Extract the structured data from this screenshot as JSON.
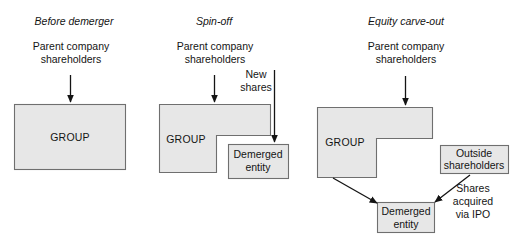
{
  "diagram": {
    "title_internal": "Demerger transaction structures",
    "colors": {
      "shape_fill": "#e7e7e7",
      "shape_stroke": "#6f6f6f",
      "arrow": "#141414",
      "background": "#ffffff",
      "text": "#141414"
    },
    "panels": [
      {
        "id": "before-demerger",
        "title": "Before demerger",
        "shareholders_line1": "Parent company",
        "shareholders_line2": "shareholders",
        "group_label": "GROUP"
      },
      {
        "id": "spin-off",
        "title": "Spin-off",
        "shareholders_line1": "Parent company",
        "shareholders_line2": "shareholders",
        "group_label": "GROUP",
        "new_shares_line1": "New",
        "new_shares_line2": "shares",
        "demerged_line1": "Demerged",
        "demerged_line2": "entity"
      },
      {
        "id": "equity-carve-out",
        "title": "Equity carve-out",
        "shareholders_line1": "Parent company",
        "shareholders_line2": "shareholders",
        "group_label": "GROUP",
        "outside_line1": "Outside",
        "outside_line2": "shareholders",
        "demerged_line1": "Demerged",
        "demerged_line2": "entity",
        "ipo_line1": "Shares",
        "ipo_line2": "acquired",
        "ipo_line3": "via IPO"
      }
    ]
  }
}
